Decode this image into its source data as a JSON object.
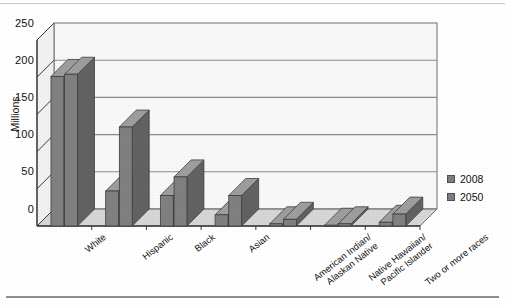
{
  "chart_data": {
    "type": "bar",
    "title": "",
    "subtitle": "",
    "xlabel": "",
    "ylabel": "Millions",
    "ylim": [
      0,
      250
    ],
    "yticks": [
      0,
      50,
      100,
      150,
      200,
      250
    ],
    "grid": true,
    "legend_position": "right",
    "style": "3d-clustered-column",
    "categories": [
      "White",
      "Hispanic",
      "Black",
      "Asian",
      "American Indian/\nAlaskan Native",
      "Native Hawaiian/\nPacific Islander",
      "Two or more races"
    ],
    "series": [
      {
        "name": "2008",
        "values": [
          201,
          47,
          41,
          15,
          3,
          1,
          5
        ]
      },
      {
        "name": "2050",
        "values": [
          204,
          133,
          66,
          41,
          9,
          3,
          16
        ]
      }
    ]
  },
  "legend": {
    "entries": [
      {
        "label": "2008",
        "color": "#7d7d7d"
      },
      {
        "label": "2050",
        "color": "#7d7d7d"
      }
    ]
  },
  "axis": {
    "y_title": "Millions",
    "y_tick_labels": [
      "250",
      "200",
      "150",
      "100",
      "50",
      "0"
    ]
  },
  "colors": {
    "bar_front": "#808080",
    "bar_side": "#626262",
    "bar_top": "#9d9d9d",
    "plot_background": "#f8f8f8",
    "floor": "#d6d6d6",
    "gridline": "#8c8c8c",
    "axis_line": "#3a3a3a",
    "page": "#ffffff"
  }
}
